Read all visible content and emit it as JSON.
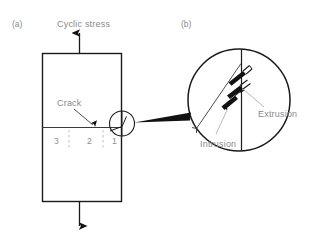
{
  "figure": {
    "title_text": "",
    "panels": [
      {
        "id": "a",
        "label": "(a)"
      },
      {
        "id": "b",
        "label": "(b)"
      }
    ],
    "colors": {
      "line": "#1a1a1a",
      "text": "#8a8a8a",
      "dashed": "#b0b0b0",
      "background": "#ffffff"
    },
    "panel_a": {
      "top_stress_label": "Cyclic stress",
      "crack_label": "Crack",
      "region_labels": [
        "3",
        "2",
        "1"
      ],
      "specimen": {
        "shape": "rectangle",
        "crack_line": "horizontal mid-height"
      },
      "arrows": {
        "top_direction": "up",
        "bottom_direction": "down"
      }
    },
    "panel_b": {
      "extrusion_label": "Extrusion",
      "intrusion_label": "Intrusion",
      "detail": "magnified slip-band view at crack tip",
      "features": {
        "surface_line": "vertical",
        "slip_plane": "diagonal",
        "slip_steps": 3
      }
    }
  }
}
